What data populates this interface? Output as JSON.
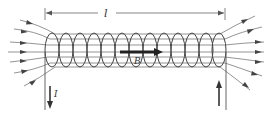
{
  "diagram": {
    "labels": {
      "length": "l",
      "field": "B",
      "current": "I"
    },
    "colors": {
      "line": "#555555",
      "bold_arrow": "#222222",
      "background": "#ffffff"
    },
    "coil_count": 13,
    "field_lines_in": 7,
    "field_lines_out": 7
  }
}
